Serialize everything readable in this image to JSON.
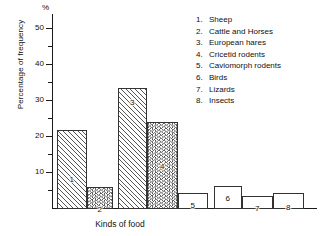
{
  "chart_data": {
    "type": "bar",
    "title": "",
    "xlabel": "Kinds of food",
    "ylabel": "Percentage of frequency",
    "yunit": "%",
    "ylim": [
      0,
      54
    ],
    "grid": false,
    "legend_position": "top-right",
    "ytick_major": [
      "10",
      "20",
      "30",
      "40",
      "50"
    ],
    "ytick_major_values": [
      10,
      20,
      30,
      40,
      50
    ],
    "ytick_minor_values": [
      5,
      15,
      25,
      35,
      45
    ],
    "categories": [
      "1",
      "2",
      "3",
      "4",
      "5",
      "6",
      "7",
      "8"
    ],
    "values": [
      21.7,
      5.8,
      33.3,
      23.9,
      4.2,
      6.1,
      3.3,
      4.2
    ],
    "bar_labels": [
      "1",
      "2",
      "3",
      "4",
      "5",
      "6",
      "7",
      "8"
    ],
    "fills": [
      "diagonal-hatch",
      "chevron-hatch",
      "diagonal-hatch",
      "chevron-hatch",
      "none",
      "none",
      "none",
      "none"
    ],
    "legend": [
      {
        "num": "1.",
        "label": "Sheep"
      },
      {
        "num": "2.",
        "label": "Cattle and Horses"
      },
      {
        "num": "3.",
        "label": "European hares"
      },
      {
        "num": "4.",
        "label": "Cricetid rodents"
      },
      {
        "num": "5.",
        "label": "Caviomorph rodents"
      },
      {
        "num": "6.",
        "label": "Birds"
      },
      {
        "num": "7.",
        "label": "Lizards"
      },
      {
        "num": "8.",
        "label": "Insects"
      }
    ],
    "colors": {
      "axis": "#1a1a1a",
      "hatch": "#555555",
      "bar_outline": "#333333",
      "bar_fill": "#ffffff",
      "text": "#111111",
      "background": "#ffffff"
    }
  }
}
